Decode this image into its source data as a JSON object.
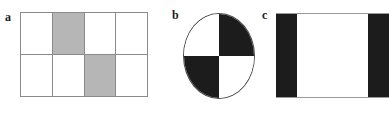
{
  "figure": {
    "background_color": "#ffffff",
    "width": 389,
    "height": 115,
    "shaded_color": "#b6b6b6",
    "black_color": "#1c1c1c",
    "white_color": "#ffffff",
    "line_color": "#8a8a8a"
  },
  "panels": [
    {
      "id": "a",
      "label": "a",
      "shape": "grid-rectangle",
      "columns": 4,
      "rows": 2,
      "cells": [
        [
          {
            "fill": "white"
          },
          {
            "fill": "gray"
          },
          {
            "fill": "white"
          },
          {
            "fill": "white"
          }
        ],
        [
          {
            "fill": "white"
          },
          {
            "fill": "white"
          },
          {
            "fill": "gray"
          },
          {
            "fill": "white"
          }
        ]
      ]
    },
    {
      "id": "b",
      "label": "b",
      "shape": "circle-quadrants",
      "quadrants": [
        {
          "position": "top-left",
          "fill": "white"
        },
        {
          "position": "top-right",
          "fill": "black"
        },
        {
          "position": "bottom-left",
          "fill": "black"
        },
        {
          "position": "bottom-right",
          "fill": "white"
        }
      ]
    },
    {
      "id": "c",
      "label": "c",
      "shape": "banded-rectangle",
      "bands": [
        {
          "fill": "black",
          "width_pct": 19
        },
        {
          "fill": "white",
          "width_pct": 62
        },
        {
          "fill": "black",
          "width_pct": 19
        }
      ]
    }
  ]
}
